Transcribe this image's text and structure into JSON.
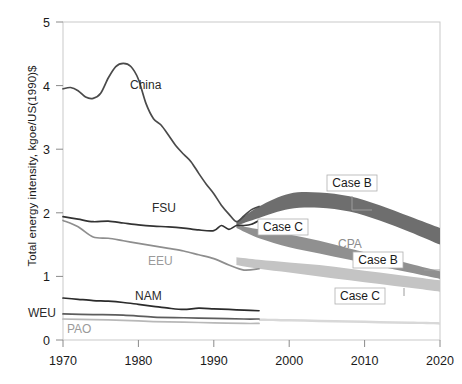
{
  "chart_data": {
    "type": "line",
    "title": "",
    "xlabel": "",
    "ylabel": "Total energy intensity, kgoe/US(1990)$",
    "xlim": [
      1970,
      2020
    ],
    "ylim": [
      0,
      5
    ],
    "xticks": [
      "1970",
      "1980",
      "1990",
      "2000",
      "2010",
      "2020"
    ],
    "xtick_values": [
      1970,
      1980,
      1990,
      2000,
      2010,
      2020
    ],
    "yticks": [
      "0",
      "1",
      "2",
      "3",
      "4",
      "5"
    ],
    "ytick_values": [
      0,
      1,
      2,
      3,
      4,
      5
    ],
    "grid": false,
    "legend": "inline-annotations",
    "series": [
      {
        "name": "China",
        "color": "#4a4a4a",
        "x": [
          1970,
          1971,
          1972,
          1973,
          1974,
          1975,
          1976,
          1977,
          1978,
          1979,
          1980,
          1981,
          1982,
          1983,
          1984,
          1985,
          1986,
          1987,
          1988,
          1989,
          1990,
          1991,
          1992,
          1993,
          1994,
          1995,
          1996
        ],
        "values": [
          3.95,
          3.97,
          3.92,
          3.82,
          3.8,
          3.88,
          4.12,
          4.3,
          4.35,
          4.3,
          4.1,
          3.72,
          3.48,
          3.38,
          3.22,
          3.05,
          2.92,
          2.8,
          2.62,
          2.45,
          2.3,
          2.12,
          1.98,
          1.86,
          1.95,
          2.05,
          2.1
        ]
      },
      {
        "name": "FSU",
        "color": "#333333",
        "x": [
          1970,
          1972,
          1974,
          1976,
          1978,
          1980,
          1982,
          1984,
          1986,
          1988,
          1990,
          1991,
          1992,
          1993,
          1994,
          1995,
          1996
        ],
        "values": [
          1.94,
          1.9,
          1.86,
          1.87,
          1.84,
          1.81,
          1.79,
          1.78,
          1.76,
          1.73,
          1.72,
          1.8,
          1.74,
          1.8,
          1.8,
          1.82,
          1.88
        ]
      },
      {
        "name": "EEU",
        "color": "#8e8e8e",
        "x": [
          1970,
          1972,
          1974,
          1976,
          1978,
          1980,
          1982,
          1984,
          1986,
          1988,
          1990,
          1992,
          1994,
          1996
        ],
        "values": [
          1.88,
          1.78,
          1.62,
          1.6,
          1.56,
          1.52,
          1.48,
          1.44,
          1.4,
          1.34,
          1.28,
          1.18,
          1.1,
          1.12
        ]
      },
      {
        "name": "NAM",
        "color": "#2b2b2b",
        "x": [
          1970,
          1972,
          1974,
          1976,
          1978,
          1980,
          1982,
          1984,
          1986,
          1988,
          1990,
          1992,
          1994,
          1996
        ],
        "values": [
          0.66,
          0.64,
          0.62,
          0.61,
          0.59,
          0.56,
          0.53,
          0.5,
          0.48,
          0.5,
          0.49,
          0.48,
          0.47,
          0.46
        ]
      },
      {
        "name": "WEU",
        "color": "#5d5d5d",
        "x": [
          1970,
          1974,
          1978,
          1982,
          1986,
          1990,
          1994,
          1996
        ],
        "values": [
          0.41,
          0.4,
          0.39,
          0.36,
          0.35,
          0.34,
          0.33,
          0.33
        ]
      },
      {
        "name": "PAO",
        "color": "#b8b8b8",
        "x": [
          1970,
          1974,
          1978,
          1982,
          1986,
          1990,
          1994,
          1996
        ],
        "values": [
          0.33,
          0.32,
          0.31,
          0.29,
          0.28,
          0.27,
          0.26,
          0.26
        ]
      }
    ],
    "bands": [
      {
        "name": "Case B upper band",
        "label": "Case B",
        "color": "#6e6e6e",
        "x": [
          1993,
          1996,
          2000,
          2004,
          2008,
          2012,
          2016,
          2020
        ],
        "upper": [
          1.86,
          2.1,
          2.3,
          2.32,
          2.26,
          2.12,
          1.94,
          1.76
        ],
        "lower": [
          1.8,
          1.92,
          2.06,
          2.08,
          2.02,
          1.88,
          1.7,
          1.5
        ]
      },
      {
        "name": "Case C upper band",
        "label": "Case C",
        "color": "#909090",
        "x": [
          1993,
          1996,
          2000,
          2004,
          2008,
          2012,
          2016,
          2020
        ],
        "upper": [
          1.8,
          1.74,
          1.66,
          1.56,
          1.44,
          1.32,
          1.2,
          1.08
        ],
        "lower": [
          1.76,
          1.6,
          1.46,
          1.36,
          1.26,
          1.16,
          1.06,
          0.96
        ]
      },
      {
        "name": "Case B lower band",
        "label": "Case B",
        "color": "#c4c4c4",
        "x": [
          1993,
          1996,
          2000,
          2004,
          2008,
          2012,
          2016,
          2020
        ],
        "upper": [
          1.3,
          1.26,
          1.22,
          1.18,
          1.12,
          1.06,
          1.0,
          0.94
        ],
        "lower": [
          1.18,
          1.12,
          1.06,
          1.0,
          0.94,
          0.88,
          0.82,
          0.76
        ]
      },
      {
        "name": "Case C lower band",
        "label": "Case C",
        "color": "#d8d8d8",
        "x": [
          1996,
          2000,
          2004,
          2008,
          2012,
          2016,
          2020
        ],
        "upper": [
          0.34,
          0.33,
          0.32,
          0.31,
          0.3,
          0.29,
          0.28
        ],
        "lower": [
          0.3,
          0.29,
          0.28,
          0.27,
          0.26,
          0.25,
          0.24
        ]
      }
    ],
    "annotations": [
      {
        "text": "China",
        "x": 130,
        "y": 89,
        "style": "dark"
      },
      {
        "text": "FSU",
        "x": 152,
        "y": 212,
        "style": "dark"
      },
      {
        "text": "EEU",
        "x": 148,
        "y": 265,
        "style": "light"
      },
      {
        "text": "NAM",
        "x": 135,
        "y": 300,
        "style": "dark"
      },
      {
        "text": "WEU",
        "x": 28,
        "y": 317,
        "style": "dark"
      },
      {
        "text": "PAO",
        "x": 67,
        "y": 333,
        "style": "light"
      },
      {
        "text": "Case B",
        "x": 352,
        "y": 187,
        "style": "boxed"
      },
      {
        "text": "Case C",
        "x": 283,
        "y": 231,
        "style": "boxed"
      },
      {
        "text": "CPA",
        "x": 338,
        "y": 248,
        "style": "cpa"
      },
      {
        "text": "Case B",
        "x": 378,
        "y": 264,
        "style": "boxed"
      },
      {
        "text": "Case C",
        "x": 360,
        "y": 300,
        "style": "boxed"
      }
    ]
  }
}
